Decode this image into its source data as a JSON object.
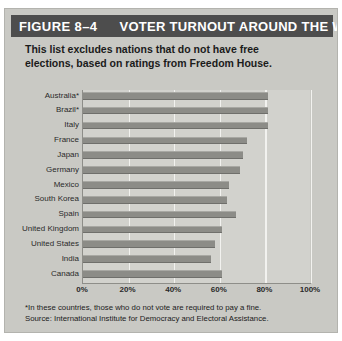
{
  "figure": {
    "header": {
      "number_label": "FIGURE 8–4",
      "title": "VOTER TURNOUT AROUND THE WORLD",
      "bar_color": "#4d4d4d",
      "text_color": "#ffffff"
    },
    "subtitle_line1": "This list excludes nations that do not have free",
    "subtitle_line2": "elections, based on ratings from Freedom House.",
    "footnote": "*In these countries, those who do not vote are required to pay a fine.",
    "source": "Source: International Institute for Democracy and  Electoral Assistance.",
    "panel_color": "#c9c9c4",
    "plot_color": "#d2d2cd",
    "bar_color": "#8c8c87",
    "gridline_color": "#f2f2ef"
  },
  "chart_data": {
    "type": "bar",
    "orientation": "horizontal",
    "title": "VOTER TURNOUT AROUND THE WORLD",
    "xlabel": "",
    "ylabel": "",
    "xlim": [
      0,
      100
    ],
    "grid": true,
    "legend": "none",
    "tick_labels": [
      "0%",
      "20%",
      "40%",
      "60%",
      "80%",
      "100%"
    ],
    "ticks": [
      0,
      20,
      40,
      60,
      80,
      100
    ],
    "categories": [
      "Australia*",
      "Brazil*",
      "Italy",
      "France",
      "Japan",
      "Germany",
      "Mexico",
      "South Korea",
      "Spain",
      "United Kingdom",
      "United States",
      "India",
      "Canada"
    ],
    "values": [
      81,
      81,
      81,
      72,
      70,
      69,
      64,
      63,
      67,
      61,
      58,
      56,
      61
    ],
    "unit": "%"
  }
}
